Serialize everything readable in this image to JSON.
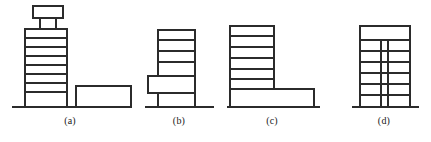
{
  "figure": {
    "type": "technical-line-drawing",
    "background_color": "#ffffff",
    "stroke_color": "#2b2b2b",
    "panel_count": 4,
    "labels": [
      {
        "text": "(a)",
        "x": 70,
        "y": 121
      },
      {
        "text": "(b)",
        "x": 179,
        "y": 121
      },
      {
        "text": "(c)",
        "x": 272,
        "y": 121
      },
      {
        "text": "(d)",
        "x": 384,
        "y": 121
      }
    ],
    "panels": [
      {
        "key": "a",
        "label": "(a)",
        "description": "Tall tower with roof-top penthouse on two legs, plus a separate low-rise block at right",
        "ground_line": {
          "x1": 12,
          "x2": 131,
          "y": 107
        },
        "shapes": [
          {
            "name": "tower-body",
            "type": "rect",
            "x": 25,
            "y": 29,
            "w": 42,
            "h": 78
          },
          {
            "name": "penthouse-box",
            "type": "rect",
            "x": 33,
            "y": 6,
            "w": 30,
            "h": 12
          },
          {
            "name": "penthouse-leg-left",
            "type": "line",
            "x1": 40,
            "y1": 18,
            "x2": 40,
            "y2": 29
          },
          {
            "name": "penthouse-leg-right",
            "type": "line",
            "x1": 56,
            "y1": 18,
            "x2": 56,
            "y2": 29
          },
          {
            "name": "low-rise-block",
            "type": "rect",
            "x": 76,
            "y": 86,
            "w": 55,
            "h": 21
          }
        ],
        "floor_lines_y": [
          38,
          47,
          56,
          65,
          74,
          83,
          92
        ],
        "floor_count": 8
      },
      {
        "key": "b",
        "label": "(b)",
        "description": "Tower with a lower block projecting to the left at mid-height",
        "ground_line": {
          "x1": 145,
          "x2": 214,
          "y": 107
        },
        "shapes": [
          {
            "name": "tower-body",
            "type": "rect",
            "x": 158,
            "y": 30,
            "w": 37,
            "h": 77
          },
          {
            "name": "projecting-block",
            "type": "rect",
            "x": 148,
            "y": 76,
            "w": 47,
            "h": 17
          }
        ],
        "floor_lines_y": [
          40,
          51,
          62,
          76,
          93
        ],
        "floor_count": 6
      },
      {
        "key": "c",
        "label": "(c)",
        "description": "Tower at left with a wide low podium extending to the right",
        "ground_line": {
          "x1": 227,
          "x2": 320,
          "y": 107
        },
        "shapes": [
          {
            "name": "tower-body",
            "type": "rect",
            "x": 230,
            "y": 26,
            "w": 44,
            "h": 81
          },
          {
            "name": "podium-block",
            "type": "rect",
            "x": 230,
            "y": 89,
            "w": 84,
            "h": 18
          }
        ],
        "floor_lines_y": [
          36,
          47,
          58,
          69,
          79,
          89
        ],
        "floor_count": 7
      },
      {
        "key": "d",
        "label": "(d)",
        "description": "Tower with horizontal floor lines and two close vertical column lines forming a central bay",
        "ground_line": {
          "x1": 352,
          "x2": 419,
          "y": 107
        },
        "shapes": [
          {
            "name": "tower-body",
            "type": "rect",
            "x": 360,
            "y": 26,
            "w": 50,
            "h": 81
          }
        ],
        "floor_lines_y": [
          40,
          51,
          62,
          73,
          84,
          95
        ],
        "column_lines_x": [
          381,
          388
        ],
        "column_top_y": 40,
        "floor_count": 7
      }
    ]
  }
}
